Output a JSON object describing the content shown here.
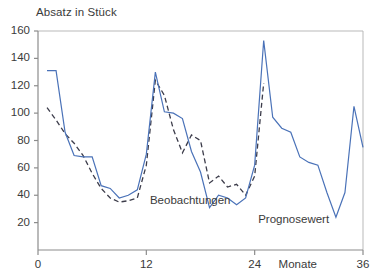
{
  "chart_data": {
    "type": "line",
    "title": "Absatz in Stück",
    "xlabel": "Monate",
    "ylabel": "Absatz in Stück",
    "xlim": [
      0,
      36
    ],
    "ylim": [
      0,
      160
    ],
    "xticks": [
      0,
      12,
      24,
      36
    ],
    "xtick_labels": [
      "0",
      "12",
      "24",
      "36"
    ],
    "yticks": [
      20,
      40,
      60,
      80,
      100,
      120,
      140,
      160
    ],
    "ytick_labels": [
      "20",
      "40",
      "60",
      "80",
      "100",
      "120",
      "140",
      "160"
    ],
    "grid": false,
    "legend": "inline-annotations",
    "annotations": [
      {
        "text": "Beobachtungen",
        "x": 12.4,
        "y": 36
      },
      {
        "text": "Prognosewert",
        "x": 28.6,
        "y": 22
      }
    ],
    "series": [
      {
        "name": "Prognosewert",
        "style": "solid",
        "color": "#4a72b8",
        "x": [
          1,
          2,
          3,
          4,
          5,
          6,
          7,
          8,
          9,
          10,
          11,
          12,
          13,
          14,
          15,
          16,
          17,
          18,
          19,
          20,
          21,
          22,
          23,
          24,
          25,
          26,
          27,
          28,
          29,
          30,
          31,
          32,
          33,
          34,
          35,
          36
        ],
        "values": [
          131,
          131,
          86,
          69,
          68,
          68,
          47,
          45,
          38,
          40,
          44,
          70,
          130,
          101,
          100,
          96,
          72,
          57,
          31,
          40,
          38,
          33,
          38,
          62,
          153,
          97,
          89,
          86,
          68,
          64,
          62,
          42,
          24,
          42,
          105,
          75
        ]
      },
      {
        "name": "Beobachtungen",
        "style": "dashed",
        "color": "#3c3c4a",
        "x": [
          1,
          2,
          3,
          4,
          5,
          6,
          7,
          8,
          9,
          10,
          11,
          12,
          13,
          14,
          15,
          16,
          17,
          18,
          19,
          20,
          21,
          22,
          23,
          24,
          25
        ],
        "values": [
          104,
          95,
          85,
          78,
          69,
          56,
          45,
          38,
          35,
          36,
          38,
          62,
          124,
          113,
          88,
          71,
          84,
          80,
          49,
          54,
          46,
          48,
          40,
          54,
          122
        ]
      }
    ]
  },
  "axes": {
    "title": "Absatz in Stück",
    "x_axis_name": "Monate"
  }
}
